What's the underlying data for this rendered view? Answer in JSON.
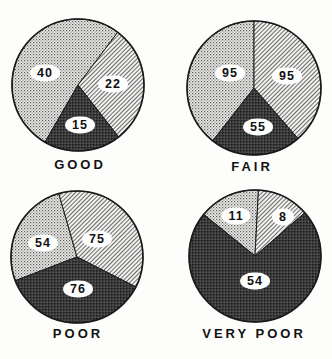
{
  "chart_data": [
    {
      "type": "pie",
      "title": "GOOD",
      "categories": [
        "dotted",
        "hatched",
        "dark"
      ],
      "values": [
        40,
        22,
        15
      ],
      "geometry": {
        "cx": 78,
        "cy": 85,
        "r": 66,
        "angles": [
          [
            120,
            307
          ],
          [
            -53,
            52
          ],
          [
            52,
            120
          ]
        ]
      },
      "label_positions": [
        [
          45,
          73
        ],
        [
          113,
          84
        ],
        [
          80,
          125
        ]
      ],
      "title_position": [
        80,
        157
      ]
    },
    {
      "type": "pie",
      "title": "FAIR",
      "categories": [
        "dotted",
        "hatched",
        "dark"
      ],
      "values": [
        95,
        95,
        55
      ],
      "geometry": {
        "cx": 254,
        "cy": 88,
        "r": 67,
        "angles": [
          [
            128,
            270
          ],
          [
            -90,
            49
          ],
          [
            49,
            128
          ]
        ]
      },
      "label_positions": [
        [
          230,
          73
        ],
        [
          287,
          76
        ],
        [
          258,
          127
        ]
      ],
      "title_position": [
        252,
        159
      ]
    },
    {
      "type": "pie",
      "title": "POOR",
      "categories": [
        "dotted",
        "hatched",
        "dark"
      ],
      "values": [
        54,
        75,
        76
      ],
      "geometry": {
        "cx": 77,
        "cy": 257,
        "r": 66,
        "angles": [
          [
            159,
            254
          ],
          [
            254,
            387
          ],
          [
            27,
            159
          ]
        ]
      },
      "label_positions": [
        [
          43,
          243
        ],
        [
          97,
          239
        ],
        [
          78,
          289
        ]
      ],
      "title_position": [
        78,
        326
      ]
    },
    {
      "type": "pie",
      "title": "VERY POOR",
      "categories": [
        "dotted",
        "hatched",
        "dark"
      ],
      "values": [
        11,
        8,
        54
      ],
      "geometry": {
        "cx": 255,
        "cy": 256,
        "r": 66,
        "angles": [
          [
            219,
            273
          ],
          [
            -87,
            -41
          ],
          [
            -41,
            219
          ]
        ]
      },
      "label_positions": [
        [
          236,
          216
        ],
        [
          283,
          217
        ],
        [
          255,
          281
        ]
      ],
      "title_position": [
        254,
        326
      ]
    }
  ],
  "legend": [],
  "colors": {
    "outline": "#1a1a1a",
    "dots": "#555555",
    "hatch": "#444444",
    "dark": "#2a2a2a",
    "background": "#fdfdfc"
  }
}
